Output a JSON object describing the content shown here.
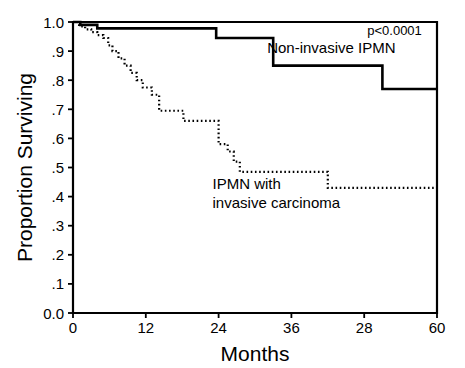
{
  "figure": {
    "kind": "kaplan-meier-survival-plot",
    "background_color": "#ffffff",
    "ink_color": "#000000"
  },
  "chart_data": {
    "type": "line",
    "title": "",
    "subtitle": "",
    "xlabel": "Months",
    "ylabel": "Proportion Surviving",
    "xlim": [
      0,
      60
    ],
    "ylim": [
      0.0,
      1.0
    ],
    "grid": false,
    "legend_position": "inline-annotations",
    "x_tick_values": [
      0,
      12,
      24,
      36,
      48,
      60
    ],
    "x_tick_labels": [
      "0",
      "12",
      "24",
      "36",
      "28",
      "60"
    ],
    "y_tick_values": [
      0.0,
      0.1,
      0.2,
      0.3,
      0.4,
      0.5,
      0.6,
      0.7,
      0.8,
      0.9,
      1.0
    ],
    "y_tick_labels": [
      "0.0",
      ".1",
      ".2",
      ".3",
      ".4",
      ".5",
      ".6",
      ".7",
      ".8",
      ".9",
      "1.0"
    ],
    "step_interpolation": "post",
    "annotations": [
      {
        "name": "p-value",
        "text": "p<0.0001",
        "x": 57.5,
        "y": 0.955,
        "anchor": "end",
        "style": "plain"
      }
    ],
    "series": [
      {
        "name": "Non-invasive IPMN",
        "label_lines": [
          "Non-invasive IPMN"
        ],
        "label_x": 32.0,
        "label_y": 0.893,
        "label_anchor": "start",
        "line_style": "solid",
        "line_width": 2.6,
        "color": "#000000",
        "x": [
          0,
          1.2,
          4.0,
          23.6,
          33.0,
          51.0,
          60.0
        ],
        "y": [
          1.0,
          0.99,
          0.978,
          0.945,
          0.85,
          0.77,
          0.77
        ]
      },
      {
        "name": "IPMN with invasive carcinoma",
        "label_lines": [
          "IPMN with",
          "invasive carcinoma"
        ],
        "label_x": 23.0,
        "label_y": 0.425,
        "label_anchor": "start",
        "line_style": "dotted",
        "line_width": 2.2,
        "color": "#000000",
        "x": [
          0,
          1.0,
          2.0,
          3.0,
          4.0,
          5.0,
          5.8,
          6.5,
          7.5,
          8.5,
          9.5,
          10.5,
          11.5,
          13.0,
          14.2,
          17.0,
          18.2,
          19.0,
          23.0,
          24.0,
          25.5,
          26.5,
          27.5,
          40.5,
          42.0,
          60.0
        ],
        "y": [
          1.0,
          0.985,
          0.975,
          0.965,
          0.955,
          0.945,
          0.92,
          0.9,
          0.875,
          0.85,
          0.825,
          0.8,
          0.775,
          0.75,
          0.695,
          0.695,
          0.66,
          0.66,
          0.66,
          0.58,
          0.555,
          0.52,
          0.485,
          0.485,
          0.43,
          0.43
        ]
      }
    ]
  },
  "layout": {
    "plot_left_px": 73,
    "plot_right_px": 437,
    "plot_top_px": 22,
    "plot_bottom_px": 313,
    "frame_stroke_width": 2.2,
    "tick_length_px": 5
  }
}
